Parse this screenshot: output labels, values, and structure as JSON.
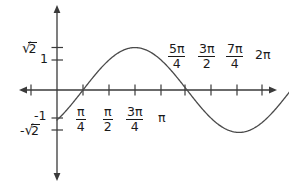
{
  "figure": {
    "title": "",
    "background_color": "#ffffff",
    "stroke_color": "#3a3a3a",
    "text_color": "#1a1a1a",
    "width": 289,
    "height": 185
  },
  "axes": {
    "x_axis_label": "",
    "y_axis_label": "",
    "x_axis_arrowheads": "both",
    "y_axis_arrowheads": "both",
    "origin_px": {
      "x": 57,
      "y": 90
    },
    "x_tick_spacing_px": 26,
    "y_unit_px": 30
  },
  "x_labels_below": [
    {
      "name": "pi-over-4",
      "numerator": "π",
      "denominator": "4",
      "value": "π/4"
    },
    {
      "name": "pi-over-2",
      "numerator": "π",
      "denominator": "2",
      "value": "π/2"
    },
    {
      "name": "three-pi-over-4",
      "numerator": "3π",
      "denominator": "4",
      "value": "3π/4"
    },
    {
      "name": "pi",
      "plain": "π",
      "value": "π"
    }
  ],
  "x_labels_above": [
    {
      "name": "five-pi-over-4",
      "numerator": "5π",
      "denominator": "4",
      "value": "5π/4"
    },
    {
      "name": "three-pi-over-2",
      "numerator": "3π",
      "denominator": "2",
      "value": "3π/2"
    },
    {
      "name": "seven-pi-over-4",
      "numerator": "7π",
      "denominator": "4",
      "value": "7π/4"
    },
    {
      "name": "two-pi",
      "plain": "2π",
      "value": "2π"
    }
  ],
  "y_labels": [
    {
      "name": "sqrt-two",
      "sign": "√",
      "radicand": "2",
      "value": "√2"
    },
    {
      "name": "one",
      "plain": "1",
      "value": "1"
    },
    {
      "name": "negative-one",
      "plain": "-1",
      "value": "-1"
    },
    {
      "name": "negative-sqrt-two",
      "sign": "√",
      "radicand": "2",
      "prefix": "-",
      "value": "-√2"
    }
  ],
  "chart_data": {
    "type": "line",
    "title": "",
    "xlabel": "",
    "ylabel": "",
    "function": "y = √2 · sin(x − π/4)",
    "amplitude": 1.414,
    "phase_shift": "π/4",
    "period": "2π",
    "xlim": [
      -0.393,
      7.46
    ],
    "ylim": [
      -1.414,
      1.414
    ],
    "grid": false,
    "legend": false,
    "x_ticks": [
      0.785,
      1.571,
      2.356,
      3.142,
      3.927,
      4.712,
      5.498,
      6.283
    ],
    "x_tick_labels": [
      "π/4",
      "π/2",
      "3π/4",
      "π",
      "5π/4",
      "3π/2",
      "7π/4",
      "2π"
    ],
    "y_ticks": [
      1.414,
      1,
      -1,
      -1.414
    ],
    "y_tick_labels": [
      "√2",
      "1",
      "-1",
      "-√2"
    ],
    "key_points": [
      {
        "x": 0,
        "y": -1,
        "note": "y-intercept"
      },
      {
        "x": 0.785,
        "y": 0,
        "note": "zero crossing (rising)"
      },
      {
        "x": 2.356,
        "y": 1.414,
        "note": "maximum"
      },
      {
        "x": 3.927,
        "y": 0,
        "note": "zero crossing (falling)"
      },
      {
        "x": 5.498,
        "y": -1.414,
        "note": "minimum"
      },
      {
        "x": 7.069,
        "y": 0,
        "note": "zero crossing (rising)"
      }
    ],
    "x": [
      0,
      0.262,
      0.524,
      0.785,
      1.047,
      1.309,
      1.571,
      1.833,
      2.094,
      2.356,
      2.618,
      2.88,
      3.142,
      3.403,
      3.665,
      3.927,
      4.189,
      4.451,
      4.712,
      4.974,
      5.236,
      5.498,
      5.76,
      6.021,
      6.283,
      6.545,
      6.807
    ],
    "y": [
      -1,
      -0.732,
      -0.366,
      0,
      0.366,
      0.732,
      1,
      1.225,
      1.366,
      1.414,
      1.366,
      1.225,
      1,
      0.732,
      0.366,
      0,
      -0.366,
      -0.732,
      -1,
      -1.225,
      -1.366,
      -1.414,
      -1.366,
      -1.225,
      -1,
      -0.732,
      -0.366
    ]
  }
}
